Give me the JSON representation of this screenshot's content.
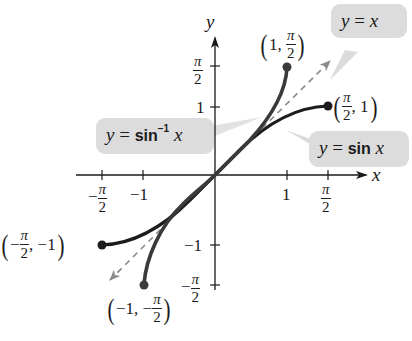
{
  "diagram": {
    "type": "function-graph",
    "axes": {
      "x_label": "x",
      "y_label": "y",
      "x_ticks": [
        {
          "value": "-π/2",
          "num": "π",
          "den": "2",
          "neg": true
        },
        {
          "value": "-1",
          "text": "−1"
        },
        {
          "value": "1",
          "text": "1"
        },
        {
          "value": "π/2",
          "num": "π",
          "den": "2",
          "neg": false
        }
      ],
      "y_ticks": [
        {
          "value": "π/2",
          "num": "π",
          "den": "2",
          "neg": false
        },
        {
          "value": "1",
          "text": "1"
        },
        {
          "value": "-1",
          "text": "−1"
        },
        {
          "value": "-π/2",
          "num": "π",
          "den": "2",
          "neg": true
        }
      ]
    },
    "curves": [
      {
        "name": "sin",
        "label_y": "y",
        "label_eq": "=",
        "label_fn": "sin",
        "label_x": "x",
        "domain": "[-π/2, π/2]",
        "color": "#1c1c1c"
      },
      {
        "name": "arcsin",
        "label_y": "y",
        "label_eq": "=",
        "label_fn": "sin",
        "label_sup": "−1",
        "label_x": "x",
        "domain": "[-1, 1]",
        "color": "#3a3a3a"
      },
      {
        "name": "identity",
        "label_y": "y",
        "label_eq": "=",
        "label_x": "x",
        "style": "dashed",
        "color": "#8a8a8a"
      }
    ],
    "points": [
      {
        "name": "arcsin-top",
        "x": "1",
        "y_num": "π",
        "y_den": "2",
        "prefix": "1,"
      },
      {
        "name": "sin-right",
        "x_num": "π",
        "x_den": "2",
        "y": "1",
        "suffix": ", 1"
      },
      {
        "name": "sin-left",
        "x_num": "π",
        "x_den": "2",
        "prefix": "−",
        "suffix": ", −1"
      },
      {
        "name": "arcsin-bottom",
        "prefix": "−1, −",
        "y_num": "π",
        "y_den": "2"
      }
    ],
    "colors": {
      "bubble": "#dcdcdc",
      "axis": "#1a1a1a",
      "dashed": "#8a8a8a"
    }
  }
}
